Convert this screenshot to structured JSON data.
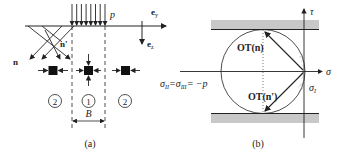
{
  "panel_a": {
    "caption": "(a)",
    "load_label": "p",
    "axis_y_label": "e",
    "axis_y_sub": "y",
    "axis_z_label": "e",
    "axis_z_sub": "z",
    "normal_n_label": "n",
    "normal_n_prime_label": "n'",
    "width_label": "B",
    "zones": [
      {
        "label": "2",
        "position": "left"
      },
      {
        "label": "1",
        "position": "center"
      },
      {
        "label": "2",
        "position": "right"
      }
    ]
  },
  "panel_b": {
    "caption": "(b)",
    "tau_axis_label": "τ",
    "sigma_axis_label": "σ",
    "sigma_I_label": "σ",
    "sigma_I_sub": "I",
    "equation_part1": "σ",
    "equation_sub1": "II",
    "equation_part2": "=σ",
    "equation_sub2": "III",
    "equation_part3": "= −p",
    "ot_n_label": "OT(n)",
    "ot_n_prime_label": "OT(n')"
  },
  "colors": {
    "line": "#222222",
    "band": "#c8c8c8"
  }
}
